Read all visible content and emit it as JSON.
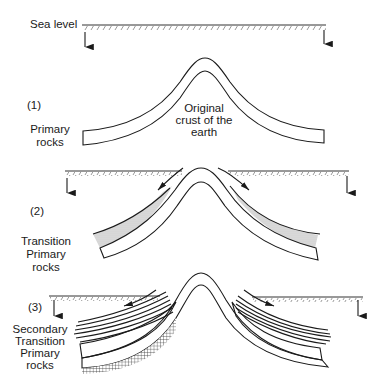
{
  "diagram": {
    "title": "",
    "sea_level_label": "Sea level",
    "stages": [
      {
        "number": "(1)",
        "rock_label_lines": [
          "Primary",
          "rocks"
        ],
        "center_label_lines": [
          "Original",
          "crust of the",
          "earth"
        ]
      },
      {
        "number": "(2)",
        "rock_label_lines": [
          "Transition",
          "Primary",
          "rocks"
        ]
      },
      {
        "number": "(3)",
        "rock_label_lines": [
          "Secondary",
          "Transition",
          "Primary",
          "rocks"
        ]
      }
    ],
    "legend_patterns": {
      "primary": "crosshatch",
      "transition": "stipple",
      "secondary": "parallel-lines"
    },
    "colors": {
      "ink": "#1a1a1a",
      "stipple": "#bdbdbd",
      "background": "#ffffff"
    }
  }
}
